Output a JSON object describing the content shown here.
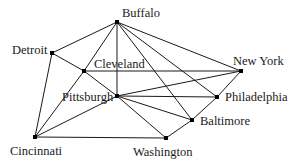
{
  "diagram": {
    "type": "graph",
    "title": "",
    "colors": {
      "edge": "#1a1a1a",
      "node": "#000000",
      "text": "#1a1a1a",
      "background": "#ffffff"
    },
    "nodes": [
      {
        "id": "buffalo",
        "label": "Buffalo",
        "x": 117,
        "y": 22,
        "lx": 122,
        "ly": 7
      },
      {
        "id": "detroit",
        "label": "Detroit",
        "x": 52,
        "y": 53,
        "lx": 12,
        "ly": 44
      },
      {
        "id": "cleveland",
        "label": "Cleveland",
        "x": 84,
        "y": 71,
        "lx": 94,
        "ly": 58
      },
      {
        "id": "newyork",
        "label": "New York",
        "x": 241,
        "y": 71,
        "lx": 233,
        "ly": 55
      },
      {
        "id": "pittsburgh",
        "label": "Pittsburgh",
        "x": 117,
        "y": 96,
        "lx": 62,
        "ly": 91
      },
      {
        "id": "philadelphia",
        "label": "Philadelphia",
        "x": 217,
        "y": 97,
        "lx": 225,
        "ly": 91
      },
      {
        "id": "baltimore",
        "label": "Baltimore",
        "x": 192,
        "y": 120,
        "lx": 200,
        "ly": 115
      },
      {
        "id": "cincinnati",
        "label": "Cincinnati",
        "x": 35,
        "y": 137,
        "lx": 10,
        "ly": 145
      },
      {
        "id": "washington",
        "label": "Washington",
        "x": 166,
        "y": 138,
        "lx": 133,
        "ly": 146
      }
    ],
    "edges": [
      [
        "buffalo",
        "detroit"
      ],
      [
        "buffalo",
        "cleveland"
      ],
      [
        "buffalo",
        "pittsburgh"
      ],
      [
        "buffalo",
        "newyork"
      ],
      [
        "buffalo",
        "philadelphia"
      ],
      [
        "buffalo",
        "baltimore"
      ],
      [
        "detroit",
        "cleveland"
      ],
      [
        "detroit",
        "cincinnati"
      ],
      [
        "cleveland",
        "pittsburgh"
      ],
      [
        "cleveland",
        "newyork"
      ],
      [
        "cleveland",
        "cincinnati"
      ],
      [
        "pittsburgh",
        "newyork"
      ],
      [
        "pittsburgh",
        "philadelphia"
      ],
      [
        "pittsburgh",
        "baltimore"
      ],
      [
        "pittsburgh",
        "washington"
      ],
      [
        "pittsburgh",
        "cincinnati"
      ],
      [
        "newyork",
        "philadelphia"
      ],
      [
        "philadelphia",
        "baltimore"
      ],
      [
        "baltimore",
        "washington"
      ],
      [
        "cincinnati",
        "washington"
      ]
    ]
  }
}
